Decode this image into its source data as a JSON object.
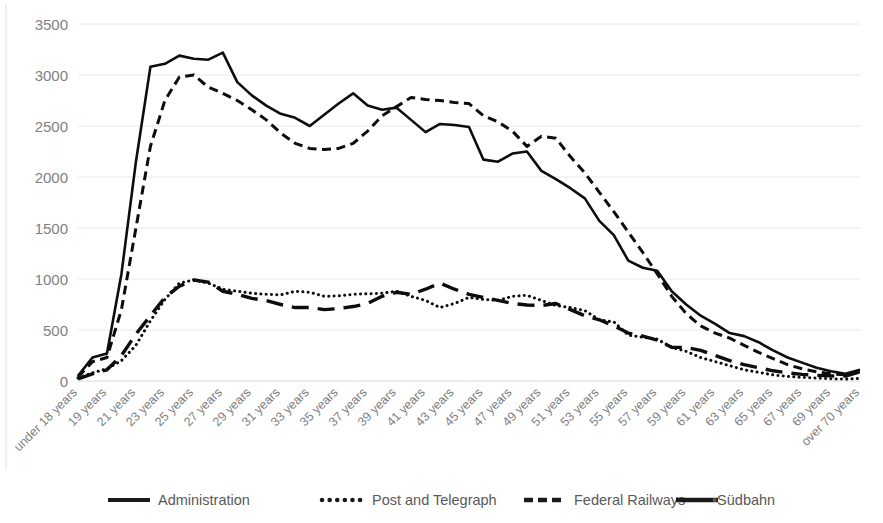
{
  "chart_data": {
    "type": "line",
    "title": "",
    "subtitle": "",
    "xlabel": "",
    "ylabel": "",
    "ylim": [
      0,
      3500
    ],
    "yticks": [
      0,
      500,
      1000,
      1500,
      2000,
      2500,
      3000,
      3500
    ],
    "grid": true,
    "legend_position": "bottom",
    "categories": [
      "under 18 years",
      "18 years",
      "19 years",
      "20 years",
      "21 years",
      "22 years",
      "23 years",
      "24 years",
      "25 years",
      "26 years",
      "27 years",
      "28 years",
      "29 years",
      "30 years",
      "31 years",
      "32 years",
      "33 years",
      "34 years",
      "35 years",
      "36 years",
      "37 years",
      "38 years",
      "39 years",
      "40 years",
      "41 years",
      "42 years",
      "43 years",
      "44 years",
      "45 years",
      "46 years",
      "47 years",
      "48 years",
      "49 years",
      "50 years",
      "51 years",
      "52 years",
      "53 years",
      "54 years",
      "55 years",
      "56 years",
      "57 years",
      "58 years",
      "59 years",
      "60 years",
      "61 years",
      "62 years",
      "63 years",
      "64 years",
      "65 years",
      "66 years",
      "67 years",
      "68 years",
      "69 years",
      "70 years",
      "over 70 years"
    ],
    "tick_labels": [
      "under 18 years",
      "",
      "19 years",
      "",
      "21 years",
      "",
      "23 years",
      "",
      "25 years",
      "",
      "27 years",
      "",
      "29 years",
      "",
      "31 years",
      "",
      "33 years",
      "",
      "35 years",
      "",
      "37 years",
      "",
      "39 years",
      "",
      "41 years",
      "",
      "43 years",
      "",
      "45 years",
      "",
      "47 years",
      "",
      "49 years",
      "",
      "51 years",
      "",
      "53 years",
      "",
      "55 years",
      "",
      "57 years",
      "",
      "59 years",
      "",
      "61 years",
      "",
      "63 years",
      "",
      "65 years",
      "",
      "67 years",
      "",
      "69 years",
      "",
      "over 70 years"
    ],
    "series": [
      {
        "name": "Administration",
        "style": "solid",
        "color": "#0d0d0d",
        "values": [
          50,
          230,
          270,
          1050,
          2150,
          3080,
          3110,
          3190,
          3160,
          3150,
          3220,
          2930,
          2800,
          2700,
          2620,
          2580,
          2500,
          2610,
          2720,
          2820,
          2700,
          2660,
          2680,
          2560,
          2440,
          2520,
          2510,
          2490,
          2170,
          2150,
          2230,
          2250,
          2060,
          1980,
          1890,
          1790,
          1570,
          1430,
          1180,
          1110,
          1080,
          880,
          750,
          640,
          560,
          470,
          440,
          380,
          300,
          230,
          180,
          130,
          95,
          70,
          110
        ]
      },
      {
        "name": "Post and Telegraph",
        "style": "dotted",
        "color": "#0d0d0d",
        "values": [
          30,
          80,
          120,
          200,
          350,
          590,
          800,
          960,
          990,
          960,
          900,
          880,
          860,
          850,
          845,
          880,
          870,
          830,
          835,
          850,
          855,
          860,
          880,
          830,
          790,
          720,
          760,
          820,
          800,
          790,
          830,
          840,
          790,
          740,
          720,
          690,
          600,
          580,
          450,
          430,
          410,
          330,
          290,
          230,
          190,
          150,
          110,
          85,
          60,
          45,
          35,
          28,
          22,
          18,
          25
        ]
      },
      {
        "name": "Federal Railways",
        "style": "dashed",
        "color": "#0d0d0d",
        "values": [
          40,
          190,
          230,
          700,
          1500,
          2300,
          2750,
          2980,
          3000,
          2880,
          2820,
          2750,
          2660,
          2560,
          2430,
          2330,
          2280,
          2270,
          2280,
          2330,
          2450,
          2600,
          2690,
          2780,
          2760,
          2750,
          2730,
          2720,
          2600,
          2540,
          2450,
          2300,
          2400,
          2380,
          2200,
          2040,
          1850,
          1660,
          1460,
          1260,
          1050,
          830,
          660,
          540,
          470,
          420,
          350,
          280,
          220,
          160,
          120,
          90,
          70,
          60,
          100
        ]
      },
      {
        "name": "Südbahn",
        "style": "long-dash",
        "color": "#0d0d0d",
        "values": [
          20,
          70,
          110,
          250,
          460,
          640,
          820,
          930,
          990,
          970,
          880,
          850,
          810,
          790,
          750,
          720,
          720,
          700,
          710,
          730,
          760,
          830,
          870,
          850,
          900,
          960,
          900,
          850,
          820,
          790,
          760,
          745,
          740,
          760,
          700,
          640,
          600,
          540,
          470,
          440,
          400,
          330,
          330,
          300,
          250,
          200,
          160,
          130,
          100,
          80,
          65,
          55,
          50,
          48,
          90
        ]
      }
    ],
    "legend": [
      {
        "label": "Administration",
        "style": "solid"
      },
      {
        "label": "Post and Telegraph",
        "style": "dotted"
      },
      {
        "label": "Federal Railways",
        "style": "dashed"
      },
      {
        "label": "•Südbahn",
        "style": "long-dash"
      }
    ]
  }
}
